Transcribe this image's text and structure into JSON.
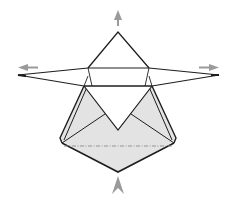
{
  "diagram": {
    "colors": {
      "line": "#1e1e1e",
      "fill": "#e3e3e3",
      "arrow": "#9a9a9a",
      "dashed": "#8a8a8a",
      "background": "#ffffff"
    },
    "arrows": [
      {
        "name": "arrow-up",
        "direction": "up"
      },
      {
        "name": "arrow-left",
        "direction": "left"
      },
      {
        "name": "arrow-right",
        "direction": "right"
      },
      {
        "name": "arrow-bottom-up",
        "direction": "up"
      }
    ],
    "fold_lines": [
      {
        "name": "valley-fold-line",
        "style": "dashed"
      }
    ]
  }
}
